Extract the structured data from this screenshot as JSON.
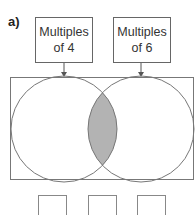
{
  "question_label": "a)",
  "sets": [
    {
      "label_line1": "Multiples",
      "label_line2": "of 4"
    },
    {
      "label_line1": "Multiples",
      "label_line2": "of 6"
    }
  ],
  "diagram": {
    "type": "venn",
    "shaded_region": "intersection",
    "shade_color": "#b3b3b3",
    "outline_color": "#777777"
  },
  "answer_boxes": [
    "",
    "",
    ""
  ]
}
